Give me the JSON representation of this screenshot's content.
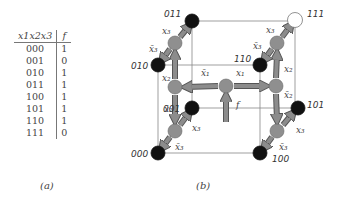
{
  "truth_table": {
    "headers": [
      "x1x2x3",
      "f"
    ],
    "rows": [
      {
        "x": "000",
        "f": "1"
      },
      {
        "x": "001",
        "f": "0"
      },
      {
        "x": "010",
        "f": "1"
      },
      {
        "x": "011",
        "f": "1"
      },
      {
        "x": "100",
        "f": "1"
      },
      {
        "x": "101",
        "f": "1"
      },
      {
        "x": "110",
        "f": "1"
      },
      {
        "x": "111",
        "f": "0"
      }
    ]
  },
  "captions": {
    "a": "(a)",
    "b": "(b)"
  },
  "cube": {
    "nodes": [
      {
        "label": "000",
        "x": 158,
        "y": 153,
        "fill": "#111111"
      },
      {
        "label": "001",
        "x": 192,
        "y": 108,
        "fill": "#111111"
      },
      {
        "label": "010",
        "x": 158,
        "y": 65,
        "fill": "#111111"
      },
      {
        "label": "011",
        "x": 192,
        "y": 21,
        "fill": "#111111"
      },
      {
        "label": "100",
        "x": 260,
        "y": 153,
        "fill": "#111111"
      },
      {
        "label": "101",
        "x": 298,
        "y": 108,
        "fill": "#111111"
      },
      {
        "label": "110",
        "x": 260,
        "y": 65,
        "fill": "#111111"
      },
      {
        "label": "111",
        "x": 295,
        "y": 20,
        "fill": "#ffffff"
      }
    ],
    "decision_nodes": [
      {
        "name": "root",
        "x": 226,
        "y": 86
      },
      {
        "name": "x2-left",
        "x": 175,
        "y": 87
      },
      {
        "name": "x2-right",
        "x": 276,
        "y": 86
      },
      {
        "name": "x3-top-left",
        "x": 175,
        "y": 43
      },
      {
        "name": "x3-bottom-left",
        "x": 175,
        "y": 131
      },
      {
        "name": "x3-top-right",
        "x": 277,
        "y": 43
      },
      {
        "name": "x3-bottom-right",
        "x": 277,
        "y": 131
      }
    ],
    "edge_labels": {
      "x1": "x₁",
      "x1bar": "x̄₁",
      "x2": "x₂",
      "x2bar": "x̄₂",
      "x3": "x₃",
      "x3bar": "x̄₃",
      "f": "f"
    },
    "colors": {
      "arrow_fill": "#8c8c8c",
      "arrow_stroke": "#555555",
      "decision_node": "#8f8f8f",
      "cube_line": "#888888"
    }
  }
}
